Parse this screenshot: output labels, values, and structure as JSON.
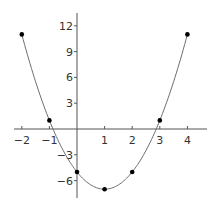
{
  "chart_data": {
    "type": "line",
    "title": "",
    "xlabel": "",
    "ylabel": "",
    "function": "y = 2x^2 - 4x - 5",
    "x": [
      -2,
      -1,
      0,
      1,
      2,
      3,
      4
    ],
    "series": [
      {
        "name": "parabola",
        "values": [
          11,
          1,
          -5,
          -7,
          -5,
          1,
          11
        ]
      }
    ],
    "xlim": [
      -2.3,
      4.7
    ],
    "ylim": [
      -8,
      13.5
    ],
    "x_ticks": [
      -2,
      -1,
      1,
      2,
      3,
      4
    ],
    "y_ticks": [
      -6,
      -3,
      3,
      6,
      9,
      12
    ],
    "x_tick_labels": [
      "−2",
      "−1",
      "1",
      "2",
      "3",
      "4"
    ],
    "y_tick_labels": [
      "−6",
      "−3",
      "3",
      "6",
      "9",
      "12"
    ],
    "grid": false,
    "legend": "none",
    "markers": true,
    "colors": {
      "curve": "#6e6e6e",
      "axis": "#555555",
      "point": "#000000",
      "text": "#333333"
    }
  }
}
